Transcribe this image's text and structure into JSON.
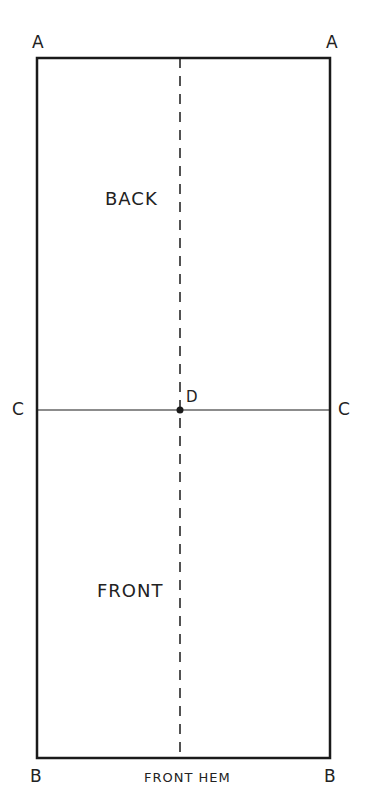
{
  "diagram": {
    "type": "pattern-layout",
    "points": {
      "top_left": "A",
      "top_right": "A",
      "mid_left": "C",
      "mid_right": "C",
      "center": "D",
      "bottom_left": "B",
      "bottom_right": "B"
    },
    "regions": {
      "upper": "BACK",
      "lower": "FRONT"
    },
    "bottom_edge_label": "FRONT HEM",
    "colors": {
      "line": "#1a1a1a",
      "background": "#ffffff"
    }
  }
}
